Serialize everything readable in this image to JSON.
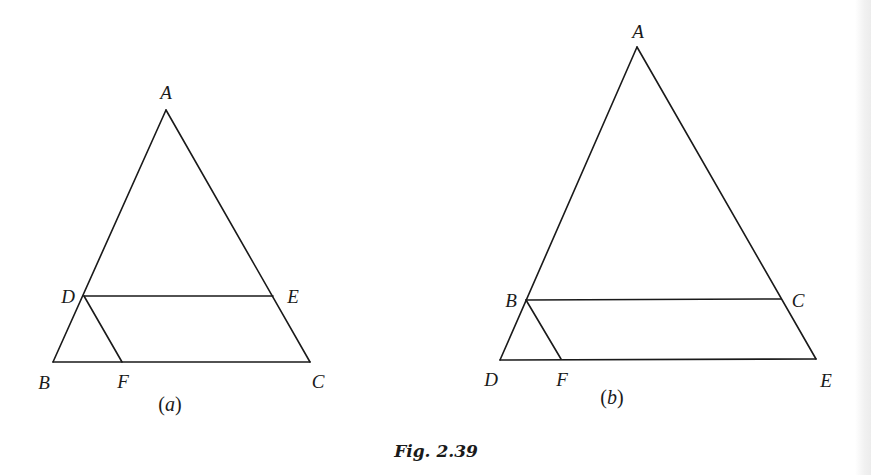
{
  "figure": {
    "caption": "Fig. 2.39",
    "line_color": "#1a1a1a",
    "stroke_width": 1.6
  },
  "panels": [
    {
      "id": "a",
      "subcaption": "(a)",
      "subcaption_letter": "a",
      "points": {
        "A": [
          166,
          110
        ],
        "B": [
          53,
          362
        ],
        "C": [
          310,
          362
        ],
        "D": [
          84,
          296
        ],
        "E": [
          273,
          296
        ],
        "F": [
          122,
          362
        ]
      },
      "segments": [
        [
          "A",
          "B"
        ],
        [
          "A",
          "C"
        ],
        [
          "B",
          "C"
        ],
        [
          "D",
          "E"
        ],
        [
          "D",
          "F"
        ]
      ],
      "labels": [
        {
          "text": "A",
          "x": 166,
          "y": 92
        },
        {
          "text": "B",
          "x": 44,
          "y": 382
        },
        {
          "text": "C",
          "x": 318,
          "y": 381
        },
        {
          "text": "D",
          "x": 68,
          "y": 296
        },
        {
          "text": "E",
          "x": 293,
          "y": 296
        },
        {
          "text": "F",
          "x": 123,
          "y": 381
        }
      ],
      "subcaption_pos": {
        "x": 170,
        "y": 404
      }
    },
    {
      "id": "b",
      "subcaption": "(b)",
      "subcaption_letter": "b",
      "points": {
        "A": [
          637,
          47
        ],
        "B": [
          526,
          300
        ],
        "C": [
          781,
          299
        ],
        "D": [
          500,
          360
        ],
        "E": [
          816,
          359
        ],
        "F": [
          561,
          359
        ]
      },
      "segments": [
        [
          "A",
          "D"
        ],
        [
          "A",
          "E"
        ],
        [
          "D",
          "E"
        ],
        [
          "B",
          "C"
        ],
        [
          "B",
          "F"
        ]
      ],
      "labels": [
        {
          "text": "A",
          "x": 638,
          "y": 31
        },
        {
          "text": "B",
          "x": 511,
          "y": 300
        },
        {
          "text": "C",
          "x": 798,
          "y": 300
        },
        {
          "text": "D",
          "x": 491,
          "y": 379
        },
        {
          "text": "E",
          "x": 826,
          "y": 380
        },
        {
          "text": "F",
          "x": 562,
          "y": 379
        }
      ],
      "subcaption_pos": {
        "x": 612,
        "y": 397
      }
    }
  ]
}
